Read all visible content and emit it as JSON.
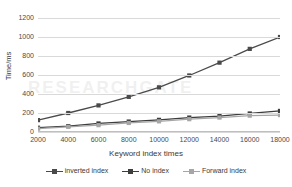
{
  "chart_data": {
    "type": "line",
    "title": "",
    "xlabel": "Keyword index times",
    "ylabel": "Time/ms",
    "x": [
      2000,
      4000,
      6000,
      8000,
      10000,
      12000,
      14000,
      16000,
      18000
    ],
    "xtick_labels": [
      "2000",
      "4000",
      "6000",
      "8000",
      "10000",
      "12000",
      "14000",
      "16000",
      "18000"
    ],
    "ytick_labels": [
      "0",
      "200",
      "400",
      "600",
      "800",
      "1000",
      "1200"
    ],
    "yticks": [
      0,
      200,
      400,
      600,
      800,
      1000,
      1200
    ],
    "ylim": [
      0,
      1200
    ],
    "xlim": [
      2000,
      18000
    ],
    "grid": "horizontal",
    "legend_position": "bottom",
    "series": [
      {
        "name": "inverted index",
        "color": "#4a4a4a",
        "marker": "square",
        "values": [
          125,
          200,
          280,
          370,
          470,
          595,
          730,
          875,
          1000
        ]
      },
      {
        "name": "No index",
        "color": "#3d3d3d",
        "marker": "square",
        "values": [
          45,
          62,
          90,
          110,
          128,
          152,
          168,
          195,
          222
        ]
      },
      {
        "name": "Forward index",
        "color": "#a6a6a6",
        "marker": "square",
        "values": [
          35,
          55,
          72,
          95,
          112,
          135,
          152,
          172,
          178
        ]
      }
    ]
  },
  "watermark": {
    "text": "RESEARCHGATE"
  }
}
